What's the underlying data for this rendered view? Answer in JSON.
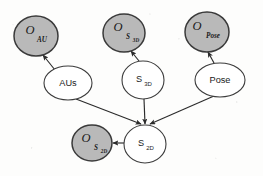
{
  "figure": {
    "background_color": "#fdfdfc",
    "observed_fill": "#b9b9b9",
    "latent_fill": "#ffffff",
    "stroke_color": "#2b2b2b"
  },
  "nodes": {
    "o_au": {
      "label_main": "O",
      "label_sub": "AU",
      "label_subsub": "",
      "type": "observed",
      "cx": 36,
      "cy": 36,
      "rx": 22,
      "ry": 20
    },
    "o_s3d": {
      "label_main": "O",
      "label_sub": "S",
      "label_subsub": "3D",
      "type": "observed",
      "cx": 124,
      "cy": 33,
      "rx": 21,
      "ry": 19
    },
    "o_pose": {
      "label_main": "O",
      "label_sub": "Pose",
      "label_subsub": "",
      "type": "observed",
      "cx": 207,
      "cy": 32,
      "rx": 22,
      "ry": 20
    },
    "aus": {
      "label_main": "AUs",
      "label_sub": "",
      "type": "latent",
      "cx": 68,
      "cy": 83,
      "rx": 24,
      "ry": 17
    },
    "s3d": {
      "label_main": "S",
      "label_sub": "3D",
      "type": "latent",
      "cx": 143,
      "cy": 80,
      "rx": 21,
      "ry": 19
    },
    "pose": {
      "label_main": "Pose",
      "label_sub": "",
      "type": "latent",
      "cx": 220,
      "cy": 80,
      "rx": 25,
      "ry": 17
    },
    "s2d": {
      "label_main": "S",
      "label_sub": "2D",
      "type": "latent",
      "cx": 145,
      "cy": 144,
      "rx": 21,
      "ry": 19
    },
    "o_s2d": {
      "label_main": "O",
      "label_sub": "S",
      "label_subsub": "2D",
      "type": "observed",
      "cx": 92,
      "cy": 143,
      "rx": 20,
      "ry": 18
    }
  },
  "edges": [
    {
      "id": "aus-to-o_au",
      "from": "aus",
      "to": "o_au",
      "x1": 55,
      "y1": 70,
      "x2": 43,
      "y2": 55
    },
    {
      "id": "s3d-to-o_s3d",
      "from": "s3d",
      "to": "o_s3d",
      "x1": 139,
      "y1": 61,
      "x2": 131,
      "y2": 51
    },
    {
      "id": "pose-to-o_pose",
      "from": "pose",
      "to": "o_pose",
      "x1": 214,
      "y1": 63,
      "x2": 208,
      "y2": 52
    },
    {
      "id": "aus-to-s2d",
      "from": "aus",
      "to": "s2d",
      "x1": 76,
      "y1": 99,
      "x2": 141,
      "y2": 124
    },
    {
      "id": "s3d-to-s2d",
      "from": "s3d",
      "to": "s2d",
      "x1": 144,
      "y1": 99,
      "x2": 145,
      "y2": 124
    },
    {
      "id": "pose-to-s2d",
      "from": "pose",
      "to": "s2d",
      "x1": 214,
      "y1": 96,
      "x2": 150,
      "y2": 124
    },
    {
      "id": "s2d-to-o_s2d",
      "from": "s2d",
      "to": "o_s2d",
      "x1": 124,
      "y1": 143,
      "x2": 113,
      "y2": 143
    }
  ]
}
